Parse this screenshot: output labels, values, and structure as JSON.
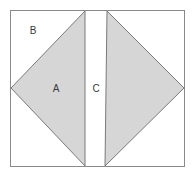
{
  "figure": {
    "canvas": {
      "width": 195,
      "height": 176
    },
    "colors": {
      "background": "#ffffff",
      "shape_fill": "#d6d6d6",
      "stroke": "#7a7a7a",
      "frame_stroke": "#8a8a8a",
      "label_text": "#3a3a3a"
    },
    "frame": {
      "name": "outer-square",
      "x": 10.5,
      "y": 10.5,
      "width": 174,
      "height": 156,
      "fill": "#ffffff",
      "stroke": "#8a8a8a",
      "stroke_width": 1
    },
    "shapes": [
      {
        "name": "triangle-a",
        "kind": "polygon",
        "points": "85,11 11,88 85,166",
        "fill": "#d6d6d6",
        "stroke": "#7a7a7a",
        "stroke_width": 1
      },
      {
        "name": "triangle-right",
        "kind": "polygon",
        "points": "107,11 184,88 105,166",
        "fill": "#d6d6d6",
        "stroke": "#7a7a7a",
        "stroke_width": 1
      }
    ],
    "labels": [
      {
        "name": "label-b",
        "text": "B",
        "x": 33,
        "y": 31
      },
      {
        "name": "label-a",
        "text": "A",
        "x": 56,
        "y": 89
      },
      {
        "name": "label-c",
        "text": "C",
        "x": 96,
        "y": 89
      }
    ]
  }
}
